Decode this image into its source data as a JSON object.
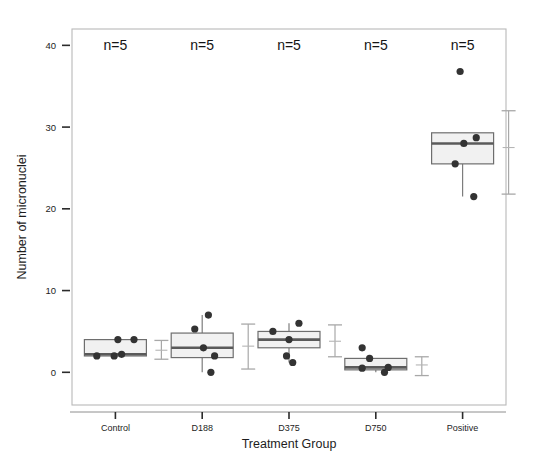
{
  "chart_data": {
    "type": "box",
    "title": "",
    "xlabel": "Treatment Group",
    "ylabel": "Number of micronuclei",
    "categories": [
      "Control",
      "D188",
      "D375",
      "D750",
      "Positive"
    ],
    "ylim": [
      -4,
      42
    ],
    "yticks": [
      0,
      10,
      20,
      30,
      40
    ],
    "ytick_labels": [
      "0",
      "10",
      "20",
      "30",
      "40"
    ],
    "grid": false,
    "legend": "none",
    "annotations": [
      {
        "group": "Control",
        "text": "n=5"
      },
      {
        "group": "D188",
        "text": "n=5"
      },
      {
        "group": "D375",
        "text": "n=5"
      },
      {
        "group": "D750",
        "text": "n=5"
      },
      {
        "group": "Positive",
        "text": "n=5"
      }
    ],
    "annotation_y": 40,
    "boxes": [
      {
        "group": "Control",
        "q1": 2.0,
        "median": 2.2,
        "q3": 4.0,
        "whisker_low": 2.0,
        "whisker_high": 4.0,
        "points": [
          2.0,
          2.0,
          2.2,
          4.0,
          4.0
        ],
        "point_offsets": [
          -0.3,
          -0.02,
          0.1,
          0.04,
          0.3
        ],
        "errorbar_low": 1.6,
        "errorbar_high": 3.9,
        "errorbar_mid": 2.7
      },
      {
        "group": "D188",
        "q1": 1.8,
        "median": 3.0,
        "q3": 4.8,
        "whisker_low": 0.0,
        "whisker_high": 7.0,
        "points": [
          0.0,
          2.0,
          3.0,
          5.3,
          7.0
        ],
        "point_offsets": [
          0.14,
          0.2,
          0.02,
          -0.12,
          0.1
        ],
        "errorbar_low": 0.4,
        "errorbar_high": 5.9,
        "errorbar_mid": 3.2
      },
      {
        "group": "D375",
        "q1": 3.0,
        "median": 4.0,
        "q3": 5.0,
        "whisker_low": 1.2,
        "whisker_high": 6.0,
        "points": [
          1.2,
          2.0,
          4.0,
          5.0,
          6.0
        ],
        "point_offsets": [
          0.06,
          -0.04,
          0.0,
          -0.26,
          0.16
        ],
        "errorbar_low": 1.9,
        "errorbar_high": 5.8,
        "errorbar_mid": 3.8
      },
      {
        "group": "D750",
        "q1": 0.3,
        "median": 0.6,
        "q3": 1.7,
        "whisker_low": 0.0,
        "whisker_high": 1.7,
        "points": [
          0.0,
          0.5,
          0.6,
          1.7,
          3.0
        ],
        "point_offsets": [
          0.14,
          -0.22,
          0.2,
          -0.1,
          -0.22
        ],
        "errorbar_low": -0.4,
        "errorbar_high": 1.9,
        "errorbar_mid": 0.9
      },
      {
        "group": "Positive",
        "q1": 25.5,
        "median": 28.0,
        "q3": 29.3,
        "whisker_low": 21.5,
        "whisker_high": 29.3,
        "points": [
          21.5,
          25.5,
          28.0,
          28.7,
          36.8
        ],
        "point_offsets": [
          0.18,
          -0.12,
          0.02,
          0.22,
          -0.04
        ],
        "errorbar_low": 21.8,
        "errorbar_high": 32.0,
        "errorbar_mid": 27.5
      }
    ]
  }
}
